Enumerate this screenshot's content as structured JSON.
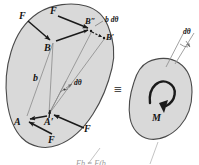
{
  "figure": {
    "equivalence_symbol": "≡",
    "body_fill": "#d9d9d9",
    "body_stroke": "#4a4a4a",
    "arrow_color": "#1a1a1a",
    "construction_line_color": "#8a8a8a"
  },
  "left_body": {
    "name": "rigid-body-with-couple",
    "labels": {
      "force_upper_left": "F",
      "force_upper_mid": "F",
      "force_lower_left": "F",
      "force_lower_right": "F",
      "point_a": "A",
      "point_a_prime": "A′",
      "point_b": "B",
      "point_b_prime": "B′",
      "point_b_double_prime": "B″",
      "distance_b": "b",
      "arc_length": "b dθ",
      "angle": "dθ"
    }
  },
  "right_body": {
    "name": "rigid-body-with-moment",
    "labels": {
      "moment": "M",
      "angle": "dθ"
    }
  },
  "caption": {
    "text": "Fb = F(b ...",
    "visible": "partial"
  }
}
